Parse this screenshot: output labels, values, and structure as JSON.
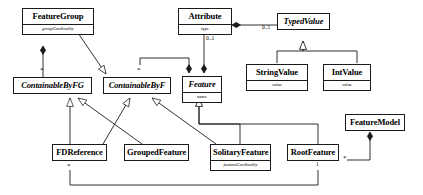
{
  "diagram": {
    "kind": "uml-class-diagram",
    "colors": {
      "line": "#1a1a1a",
      "fill": "#ffffff",
      "text": "#000000"
    },
    "classes": [
      {
        "id": "feature-group",
        "name": "FeatureGroup",
        "abstract": false,
        "attributes": [
          "groupCardinality"
        ]
      },
      {
        "id": "attribute",
        "name": "Attribute",
        "abstract": false,
        "attributes": [
          "type"
        ]
      },
      {
        "id": "typed-value",
        "name": "TypedValue",
        "abstract": true,
        "attributes": []
      },
      {
        "id": "containable-by-fg",
        "name": "ContainableByFG",
        "abstract": true,
        "attributes": []
      },
      {
        "id": "containable-by-f",
        "name": "ContainableByF",
        "abstract": true,
        "attributes": []
      },
      {
        "id": "feature",
        "name": "Feature",
        "abstract": true,
        "attributes": [
          "name"
        ]
      },
      {
        "id": "string-value",
        "name": "StringValue",
        "abstract": false,
        "attributes": [
          "value"
        ]
      },
      {
        "id": "int-value",
        "name": "IntValue",
        "abstract": false,
        "attributes": [
          "value"
        ]
      },
      {
        "id": "feature-model",
        "name": "FeatureModel",
        "abstract": false,
        "attributes": []
      },
      {
        "id": "fd-reference",
        "name": "FDReference",
        "abstract": false,
        "attributes": []
      },
      {
        "id": "grouped-feature",
        "name": "GroupedFeature",
        "abstract": false,
        "attributes": []
      },
      {
        "id": "solitary-feature",
        "name": "SolitaryFeature",
        "abstract": false,
        "attributes": [
          "featureCardinality"
        ]
      },
      {
        "id": "root-feature",
        "name": "RootFeature",
        "abstract": false,
        "attributes": []
      }
    ],
    "multiplicities": [
      {
        "id": "m-cbfg-star",
        "label": "*"
      },
      {
        "id": "m-cbf-star",
        "label": "*"
      },
      {
        "id": "m-attr-01",
        "label": "0..1"
      },
      {
        "id": "m-typedvalue-01",
        "label": "0..1"
      },
      {
        "id": "m-fdref-star",
        "label": "*"
      },
      {
        "id": "m-rootfeature-star",
        "label": "*"
      },
      {
        "id": "m-rootfeature-1",
        "label": "1"
      }
    ],
    "relations": [
      {
        "from": "feature-group",
        "to": "containable-by-fg",
        "type": "composition"
      },
      {
        "from": "feature",
        "to": "containable-by-f",
        "type": "composition"
      },
      {
        "from": "containable-by-f",
        "to": "feature",
        "type": "composition"
      },
      {
        "from": "attribute",
        "to": "feature",
        "type": "composition"
      },
      {
        "from": "typed-value",
        "to": "attribute",
        "type": "composition"
      },
      {
        "from": "feature-group",
        "to": "containable-by-f",
        "type": "generalization"
      },
      {
        "from": "string-value",
        "to": "typed-value",
        "type": "generalization"
      },
      {
        "from": "int-value",
        "to": "typed-value",
        "type": "generalization"
      },
      {
        "from": "fd-reference",
        "to": "containable-by-fg",
        "type": "generalization"
      },
      {
        "from": "fd-reference",
        "to": "containable-by-f",
        "type": "generalization"
      },
      {
        "from": "grouped-feature",
        "to": "containable-by-fg",
        "type": "generalization"
      },
      {
        "from": "solitary-feature",
        "to": "containable-by-f",
        "type": "generalization"
      },
      {
        "from": "solitary-feature",
        "to": "feature",
        "type": "generalization"
      },
      {
        "from": "root-feature",
        "to": "feature",
        "type": "generalization"
      },
      {
        "from": "feature-model",
        "to": "root-feature",
        "type": "composition"
      },
      {
        "from": "root-feature",
        "to": "fd-reference",
        "type": "association"
      }
    ]
  }
}
